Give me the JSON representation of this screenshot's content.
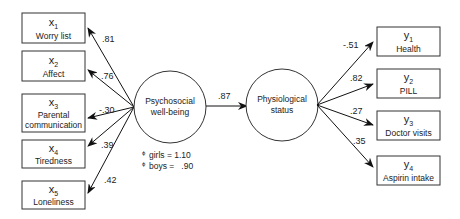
{
  "latent": {
    "psychosocial": {
      "line1": "Psychosocial",
      "line2": "well-being"
    },
    "physiological": {
      "line1": "Physiological",
      "line2": "status"
    }
  },
  "structural_path": {
    "coefficient": ".87"
  },
  "variances": [
    {
      "symbol": "ϕ",
      "label": "girls = 1.10"
    },
    {
      "symbol": "ϕ",
      "label": "boys =   .90"
    }
  ],
  "x_indicators": [
    {
      "var": "x",
      "sub": "1",
      "name": "Worry list",
      "loading": ".81"
    },
    {
      "var": "x",
      "sub": "2",
      "name": "Affect",
      "loading": ".76"
    },
    {
      "var": "x",
      "sub": "3",
      "name": "Parental",
      "name2": "communication",
      "loading": "-.30"
    },
    {
      "var": "x",
      "sub": "4",
      "name": "Tiredness",
      "loading": ".39"
    },
    {
      "var": "x",
      "sub": "5",
      "name": "Loneliness",
      "loading": ".42"
    }
  ],
  "y_indicators": [
    {
      "var": "y",
      "sub": "1",
      "name": "Health",
      "loading": "-.51"
    },
    {
      "var": "y",
      "sub": "2",
      "name": "PILL",
      "loading": ".82"
    },
    {
      "var": "y",
      "sub": "3",
      "name": "Doctor visits",
      "loading": ".27"
    },
    {
      "var": "y",
      "sub": "4",
      "name": "Aspirin intake",
      "loading": ".35"
    }
  ]
}
